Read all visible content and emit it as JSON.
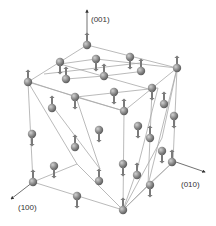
{
  "diagram": {
    "type": "crystal-lattice-spin-structure",
    "axes": [
      {
        "label": "(001)",
        "from": [
          87,
          40
        ],
        "to": [
          87,
          10
        ],
        "label_pos": [
          91,
          16
        ]
      },
      {
        "label": "(100)",
        "from": [
          33,
          182
        ],
        "to": [
          11,
          199
        ],
        "label_pos": [
          18,
          204
        ]
      },
      {
        "label": "(010)",
        "from": [
          173,
          161
        ],
        "to": [
          205,
          172
        ],
        "label_pos": [
          181,
          181
        ]
      }
    ],
    "colors": {
      "bond": "#a8a8a8",
      "atom_fill": "#8a8a8a",
      "atom_highlight": "#c8c8c8",
      "spin": "#7a7a7a",
      "axis": "#333333"
    },
    "bonds": [
      [
        [
          87,
          45
        ],
        [
          28,
          82
        ]
      ],
      [
        [
          87,
          45
        ],
        [
          177,
          68
        ]
      ],
      [
        [
          28,
          82
        ],
        [
          124,
          111
        ]
      ],
      [
        [
          177,
          68
        ],
        [
          124,
          111
        ]
      ],
      [
        [
          60,
          64
        ],
        [
          152,
          90
        ]
      ],
      [
        [
          60,
          64
        ],
        [
          96,
          59
        ]
      ],
      [
        [
          96,
          59
        ],
        [
          177,
          68
        ]
      ],
      [
        [
          30,
          82
        ],
        [
          76,
          97
        ]
      ],
      [
        [
          76,
          97
        ],
        [
          158,
          88
        ]
      ],
      [
        [
          44,
          74
        ],
        [
          140,
          63
        ]
      ],
      [
        [
          66,
          79
        ],
        [
          104,
          76
        ]
      ],
      [
        [
          104,
          76
        ],
        [
          137,
          72
        ]
      ],
      [
        [
          28,
          82
        ],
        [
          33,
          182
        ]
      ],
      [
        [
          33,
          182
        ],
        [
          123,
          210
        ]
      ],
      [
        [
          123,
          210
        ],
        [
          173,
          162
        ]
      ],
      [
        [
          173,
          162
        ],
        [
          177,
          68
        ]
      ],
      [
        [
          124,
          111
        ],
        [
          123,
          210
        ]
      ],
      [
        [
          28,
          82
        ],
        [
          77,
          164
        ]
      ],
      [
        [
          77,
          164
        ],
        [
          123,
          210
        ]
      ],
      [
        [
          76,
          97
        ],
        [
          100,
          169
        ]
      ],
      [
        [
          54,
          108
        ],
        [
          100,
          169
        ]
      ],
      [
        [
          33,
          182
        ],
        [
          77,
          164
        ]
      ],
      [
        [
          152,
          90
        ],
        [
          148,
          185
        ]
      ],
      [
        [
          148,
          185
        ],
        [
          123,
          210
        ]
      ],
      [
        [
          177,
          68
        ],
        [
          148,
          185
        ]
      ],
      [
        [
          177,
          68
        ],
        [
          162,
          138
        ]
      ],
      [
        [
          162,
          138
        ],
        [
          123,
          210
        ]
      ],
      [
        [
          158,
          88
        ],
        [
          137,
          170
        ]
      ],
      [
        [
          137,
          170
        ],
        [
          123,
          210
        ]
      ],
      [
        [
          124,
          111
        ],
        [
          76,
          97
        ]
      ],
      [
        [
          173,
          162
        ],
        [
          148,
          185
        ]
      ]
    ],
    "atoms": [
      {
        "x": 87,
        "y": 45,
        "spin": "up"
      },
      {
        "x": 60,
        "y": 62,
        "spin": "down"
      },
      {
        "x": 96,
        "y": 59,
        "spin": "down"
      },
      {
        "x": 130,
        "y": 57,
        "spin": "down"
      },
      {
        "x": 177,
        "y": 68,
        "spin": "up"
      },
      {
        "x": 28,
        "y": 82,
        "spin": "up"
      },
      {
        "x": 66,
        "y": 79,
        "spin": "up"
      },
      {
        "x": 104,
        "y": 76,
        "spin": "up"
      },
      {
        "x": 141,
        "y": 71,
        "spin": "up"
      },
      {
        "x": 75,
        "y": 97,
        "spin": "down"
      },
      {
        "x": 114,
        "y": 92,
        "spin": "down"
      },
      {
        "x": 152,
        "y": 88,
        "spin": "down"
      },
      {
        "x": 124,
        "y": 111,
        "spin": "up"
      },
      {
        "x": 164,
        "y": 104,
        "spin": "up"
      },
      {
        "x": 52,
        "y": 108,
        "spin": "up"
      },
      {
        "x": 174,
        "y": 116,
        "spin": "down"
      },
      {
        "x": 32,
        "y": 134,
        "spin": "down"
      },
      {
        "x": 99,
        "y": 130,
        "spin": "down"
      },
      {
        "x": 75,
        "y": 147,
        "spin": "up"
      },
      {
        "x": 138,
        "y": 126,
        "spin": "down"
      },
      {
        "x": 150,
        "y": 138,
        "spin": "up"
      },
      {
        "x": 54,
        "y": 166,
        "spin": "down"
      },
      {
        "x": 123,
        "y": 164,
        "spin": "down"
      },
      {
        "x": 162,
        "y": 151,
        "spin": "down"
      },
      {
        "x": 99,
        "y": 181,
        "spin": "up"
      },
      {
        "x": 137,
        "y": 175,
        "spin": "up"
      },
      {
        "x": 172,
        "y": 162,
        "spin": "up"
      },
      {
        "x": 33,
        "y": 182,
        "spin": "up"
      },
      {
        "x": 77,
        "y": 196,
        "spin": "down"
      },
      {
        "x": 150,
        "y": 185,
        "spin": "down"
      },
      {
        "x": 123,
        "y": 210,
        "spin": "up"
      }
    ]
  }
}
